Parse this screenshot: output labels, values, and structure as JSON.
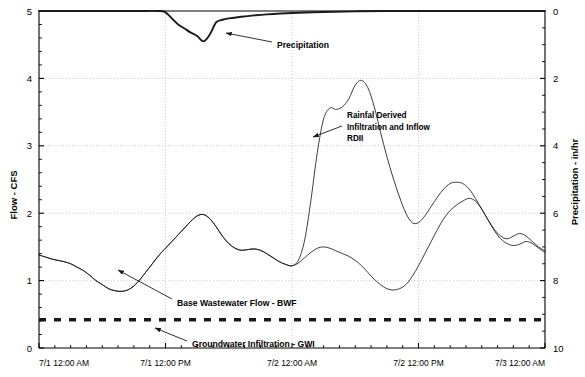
{
  "chart_data": {
    "type": "line",
    "title": "",
    "xlabel": "",
    "ylabel": "Flow - CFS",
    "y2label": "Precipitation - in/hr",
    "ylim": [
      0,
      5
    ],
    "y2lim": [
      10,
      0
    ],
    "y2_inverted": true,
    "grid": true,
    "legend_position": "none",
    "x_tick_labels": [
      "7/1 12:00 AM",
      "7/1 12:00 PM",
      "7/2 12:00 AM",
      "7/2 12:00 PM",
      "7/3 12:00 AM"
    ],
    "y_tick_labels": [
      "0",
      "1",
      "2",
      "3",
      "4",
      "5"
    ],
    "y2_tick_labels": [
      "0",
      "2",
      "4",
      "6",
      "8",
      "10"
    ],
    "x_range_hours": [
      0,
      48
    ],
    "annotations": [
      {
        "id": "precipitation",
        "text": "Precipitation",
        "text_x": 277,
        "text_y": 45,
        "arrow_from_x": 272,
        "arrow_from_y": 42,
        "arrow_to_x": 226,
        "arrow_to_y": 33
      },
      {
        "id": "rdii",
        "line1": "Rainfal Derived",
        "line2": "Infiltration and Inflow",
        "line3": "RDII",
        "text_x": 347,
        "text_y": 118,
        "arrow_from_x": 342,
        "arrow_from_y": 126,
        "arrow_to_x": 313,
        "arrow_to_y": 137
      },
      {
        "id": "bwf",
        "text": "Base Wastewater Flow - BWF",
        "text_x": 177,
        "text_y": 303,
        "arrow_from_x": 172,
        "arrow_from_y": 299,
        "arrow_to_x": 118,
        "arrow_to_y": 270
      },
      {
        "id": "gwi",
        "text": "Groundwater Infiltration - GWI",
        "text_x": 192,
        "text_y": 344,
        "arrow_from_x": 187,
        "arrow_from_y": 341,
        "arrow_to_x": 155,
        "arrow_to_y": 328
      }
    ],
    "series": [
      {
        "name": "Groundwater Infiltration - GWI",
        "style": "thick-dashed",
        "constant_value": 0.42,
        "values": [
          0.42,
          0.42
        ]
      },
      {
        "name": "Base Wastewater Flow - BWF",
        "style": "thin-solid",
        "x": [
          0.0,
          0.6,
          1.2,
          1.8,
          2.4,
          3.0,
          3.6,
          4.2,
          4.8,
          5.4,
          6.0,
          6.6,
          7.2,
          7.8,
          8.4,
          9.0,
          9.6,
          10.2,
          10.8,
          11.4,
          12.0,
          12.6,
          13.2,
          13.8,
          14.4,
          15.0,
          15.6,
          16.2,
          16.8,
          17.4,
          18.0,
          18.6,
          19.2,
          19.8,
          20.4,
          21.0,
          21.6,
          22.2,
          22.8,
          23.4,
          24.0,
          24.6,
          25.2,
          25.8,
          26.4,
          27.0,
          27.6,
          28.2,
          28.8,
          29.4,
          30.0,
          30.6,
          31.2,
          31.8,
          32.4,
          33.0,
          33.6,
          34.2,
          34.8,
          35.4,
          36.0,
          36.6,
          37.2,
          37.8,
          38.4,
          39.0,
          39.6,
          40.2,
          40.8,
          41.4,
          42.0,
          42.6,
          43.2,
          43.8,
          44.4,
          45.0,
          45.6,
          46.2,
          46.8,
          47.4,
          48.0
        ],
        "values": [
          1.38,
          1.35,
          1.32,
          1.3,
          1.28,
          1.25,
          1.2,
          1.15,
          1.08,
          1.0,
          0.94,
          0.88,
          0.85,
          0.84,
          0.86,
          0.92,
          1.02,
          1.14,
          1.26,
          1.38,
          1.48,
          1.58,
          1.68,
          1.78,
          1.88,
          1.96,
          1.98,
          1.92,
          1.8,
          1.66,
          1.55,
          1.48,
          1.45,
          1.46,
          1.47,
          1.45,
          1.4,
          1.34,
          1.28,
          1.24,
          1.22,
          1.26,
          1.34,
          1.42,
          1.48,
          1.5,
          1.48,
          1.44,
          1.4,
          1.36,
          1.3,
          1.22,
          1.12,
          1.02,
          0.94,
          0.88,
          0.86,
          0.88,
          0.94,
          1.06,
          1.22,
          1.4,
          1.58,
          1.76,
          1.92,
          2.04,
          2.12,
          2.18,
          2.22,
          2.18,
          2.06,
          1.9,
          1.74,
          1.62,
          1.55,
          1.52,
          1.54,
          1.58,
          1.55,
          1.48,
          1.42
        ]
      },
      {
        "name": "Rainfall Derived Infiltration and Inflow - RDII (total flow)",
        "style": "thin-solid",
        "x": [
          0.0,
          0.6,
          1.2,
          1.8,
          2.4,
          3.0,
          3.6,
          4.2,
          4.8,
          5.4,
          6.0,
          6.6,
          7.2,
          7.8,
          8.4,
          9.0,
          9.6,
          10.2,
          10.8,
          11.4,
          12.0,
          12.6,
          13.2,
          13.8,
          14.4,
          15.0,
          15.6,
          16.2,
          16.8,
          17.4,
          18.0,
          18.6,
          19.2,
          19.8,
          20.4,
          21.0,
          21.6,
          22.2,
          22.8,
          23.4,
          24.0,
          24.6,
          25.2,
          25.8,
          26.4,
          27.0,
          27.6,
          28.2,
          28.8,
          29.4,
          30.0,
          30.6,
          31.2,
          31.8,
          32.4,
          33.0,
          33.6,
          34.2,
          34.8,
          35.4,
          36.0,
          36.6,
          37.2,
          37.8,
          38.4,
          39.0,
          39.6,
          40.2,
          40.8,
          41.4,
          42.0,
          42.6,
          43.2,
          43.8,
          44.4,
          45.0,
          45.6,
          46.2,
          46.8,
          47.4,
          48.0
        ],
        "values": [
          1.38,
          1.35,
          1.32,
          1.3,
          1.28,
          1.25,
          1.2,
          1.15,
          1.08,
          1.0,
          0.94,
          0.88,
          0.85,
          0.84,
          0.86,
          0.92,
          1.02,
          1.14,
          1.26,
          1.38,
          1.48,
          1.58,
          1.68,
          1.78,
          1.88,
          1.96,
          1.98,
          1.92,
          1.8,
          1.66,
          1.55,
          1.48,
          1.45,
          1.46,
          1.47,
          1.45,
          1.4,
          1.34,
          1.28,
          1.24,
          1.22,
          1.3,
          1.6,
          2.2,
          2.9,
          3.4,
          3.56,
          3.54,
          3.58,
          3.7,
          3.9,
          3.97,
          3.86,
          3.58,
          3.2,
          2.84,
          2.52,
          2.24,
          2.0,
          1.86,
          1.86,
          1.96,
          2.1,
          2.24,
          2.36,
          2.44,
          2.46,
          2.44,
          2.36,
          2.22,
          2.06,
          1.9,
          1.76,
          1.66,
          1.62,
          1.66,
          1.7,
          1.66,
          1.58,
          1.5,
          1.44
        ]
      },
      {
        "name": "Precipitation",
        "style": "thick-solid",
        "axis": "right",
        "x": [
          0.0,
          3.0,
          6.0,
          9.0,
          11.4,
          12.0,
          12.6,
          13.2,
          13.8,
          14.4,
          15.0,
          15.6,
          16.2,
          16.8,
          17.4,
          18.0,
          19.2,
          20.4,
          21.6,
          24.0,
          27.0,
          30.0,
          33.0,
          36.0,
          40.0,
          44.0,
          48.0
        ],
        "values": [
          0.0,
          0.0,
          0.0,
          0.0,
          0.0,
          0.04,
          0.22,
          0.4,
          0.52,
          0.64,
          0.74,
          0.9,
          0.7,
          0.34,
          0.26,
          0.22,
          0.17,
          0.13,
          0.1,
          0.06,
          0.03,
          0.01,
          0.0,
          0.0,
          0.0,
          0.0,
          0.0
        ]
      }
    ]
  },
  "colors": {
    "axis": "#000000",
    "grid": "#bdbdbd",
    "line": "#1a1a1a",
    "background": "#ffffff"
  }
}
